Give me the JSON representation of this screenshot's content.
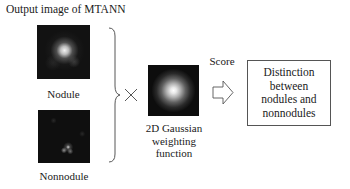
{
  "title": "Output image of MTANN",
  "nodule": {
    "label": "Nodule"
  },
  "nonnodule": {
    "label": "Nonnodule"
  },
  "operator": {
    "symbol": "multiply"
  },
  "gaussian": {
    "label_lines": [
      "2D Gaussian",
      "weighting",
      "function"
    ]
  },
  "score_label": "Score",
  "result_box": {
    "lines": [
      "Distinction",
      "between",
      "nodules and",
      "nonnodules"
    ]
  },
  "colors": {
    "image_bg": "#0d0d0d",
    "line": "#555555",
    "text": "#1a1a1a"
  }
}
